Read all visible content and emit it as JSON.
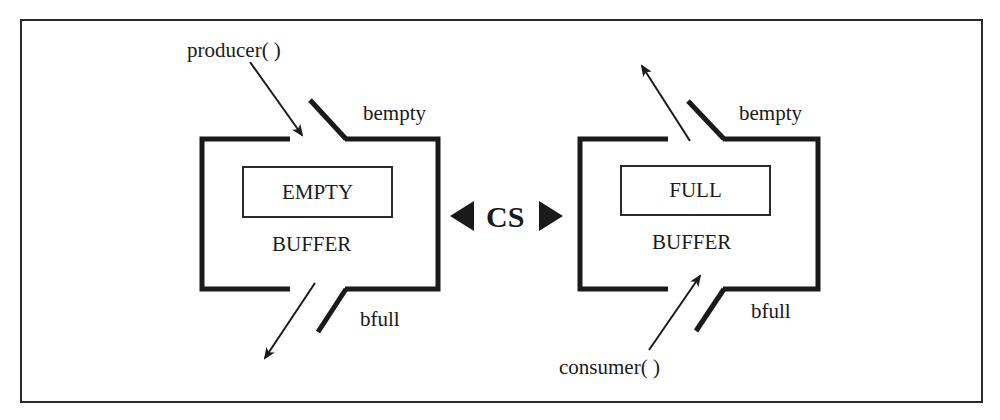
{
  "diagram": {
    "left": {
      "caller": "producer( )",
      "top_flag": "bempty",
      "state": "EMPTY",
      "name": "BUFFER",
      "bottom_flag": "bfull"
    },
    "center": {
      "label": "CS"
    },
    "right": {
      "caller": "consumer( )",
      "top_flag": "bempty",
      "state": "FULL",
      "name": "BUFFER",
      "bottom_flag": "bfull"
    },
    "colors": {
      "stroke": "#1a1a1a",
      "background": "#ffffff"
    }
  }
}
